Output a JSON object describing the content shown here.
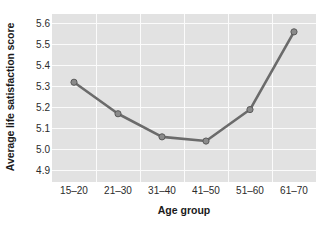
{
  "chart_data": {
    "type": "line",
    "title": "",
    "xlabel": "Age group",
    "ylabel": "Average life satisfaction score",
    "categories": [
      "15–20",
      "21–30",
      "31–40",
      "41–50",
      "51–60",
      "61–70"
    ],
    "values": [
      5.32,
      5.17,
      5.06,
      5.04,
      5.19,
      5.56
    ],
    "series": [
      {
        "name": "Average life satisfaction score",
        "values": [
          5.32,
          5.17,
          5.06,
          5.04,
          5.19,
          5.56
        ]
      }
    ],
    "yticks": [
      4.9,
      5.0,
      5.1,
      5.2,
      5.3,
      5.4,
      5.5,
      5.6
    ],
    "yticklabels": [
      "4.9",
      "5.0",
      "5.1",
      "5.2",
      "5.3",
      "5.4",
      "5.5",
      "5.6"
    ],
    "ylim": [
      4.845,
      5.645
    ],
    "xlim": [
      0,
      6
    ],
    "grid": true,
    "legend": false,
    "legend_position": "none",
    "marker": "circle",
    "line_color": "#6b6b6b",
    "marker_color": "#8a8a8a",
    "marker_edge_color": "#5a5a5a",
    "panel_background": "#e2e2e2",
    "gridline_color": "#fbfbfb",
    "figure_background": "#ffffff",
    "text_color": "#2b2b2b"
  }
}
